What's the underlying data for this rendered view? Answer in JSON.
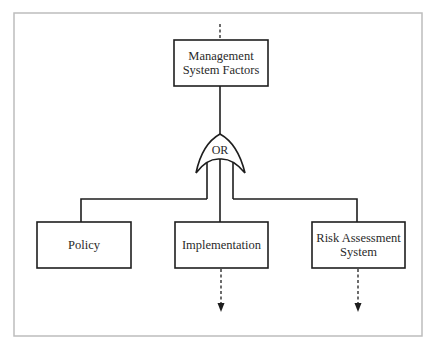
{
  "diagram": {
    "type": "fault-tree",
    "frame": {
      "x": 14,
      "y": 13,
      "w": 408,
      "h": 323,
      "color": "#bdbdbd"
    },
    "line_color": "#1e1e1e",
    "top_event": {
      "id": "management-system-factors",
      "label_line1": "Management",
      "label_line2": "System Factors",
      "incoming": "dashed-from-above"
    },
    "gate": {
      "type": "OR",
      "label": "OR"
    },
    "children": [
      {
        "id": "policy",
        "label_line1": "Policy",
        "label_line2": "",
        "continues_below": false
      },
      {
        "id": "implementation",
        "label_line1": "Implementation",
        "label_line2": "",
        "continues_below": true
      },
      {
        "id": "risk-assessment-system",
        "label_line1": "Risk Assessment",
        "label_line2": "System",
        "continues_below": true
      }
    ]
  }
}
